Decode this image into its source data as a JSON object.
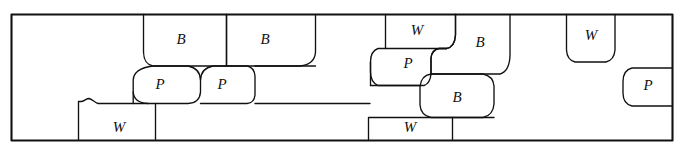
{
  "diagram": {
    "stroke_color": "#111111",
    "background_color": "#ffffff",
    "frame": {
      "x": 11,
      "y": 14,
      "width": 661,
      "height": 126
    },
    "legend_letters": [
      "B",
      "P",
      "W"
    ],
    "cells": [
      {
        "id": "b1",
        "label": "B",
        "label_x": 181,
        "label_y": 41
      },
      {
        "id": "b2",
        "label": "B",
        "label_x": 265,
        "label_y": 41
      },
      {
        "id": "p1",
        "label": "P",
        "label_x": 160,
        "label_y": 86
      },
      {
        "id": "p2",
        "label": "P",
        "label_x": 222,
        "label_y": 86
      },
      {
        "id": "w1",
        "label": "W",
        "label_x": 119,
        "label_y": 129
      },
      {
        "id": "w2",
        "label": "W",
        "label_x": 417,
        "label_y": 32
      },
      {
        "id": "p3",
        "label": "P",
        "label_x": 408,
        "label_y": 65
      },
      {
        "id": "b3",
        "label": "B",
        "label_x": 480,
        "label_y": 44
      },
      {
        "id": "b4",
        "label": "B",
        "label_x": 457,
        "label_y": 99
      },
      {
        "id": "w3",
        "label": "W",
        "label_x": 410,
        "label_y": 129
      },
      {
        "id": "w4",
        "label": "W",
        "label_x": 591,
        "label_y": 37
      },
      {
        "id": "p4",
        "label": "P",
        "label_x": 648,
        "label_y": 87
      }
    ],
    "counts": {
      "total_cells": 12,
      "b_cells": 4,
      "p_cells": 4,
      "w_cells": 4
    }
  }
}
